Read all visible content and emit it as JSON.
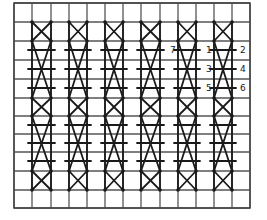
{
  "diagram": {
    "type": "stitch-chart",
    "grid": {
      "columns": 13,
      "rows": 11,
      "x_lines": [
        14,
        32,
        51,
        69,
        87,
        105,
        123,
        141,
        160,
        178,
        196,
        214,
        232,
        250
      ],
      "y_lines": [
        3,
        22,
        41,
        60,
        79,
        98,
        116,
        134,
        152,
        171,
        190,
        208
      ],
      "line_color": "#555555"
    },
    "stitch_columns": [
      {
        "x_left": 32,
        "x_right": 51
      },
      {
        "x_left": 69,
        "x_right": 87
      },
      {
        "x_left": 105,
        "x_right": 123
      },
      {
        "x_left": 141,
        "x_right": 160
      },
      {
        "x_left": 178,
        "x_right": 196
      },
      {
        "x_left": 214,
        "x_right": 232
      }
    ],
    "stitch_segments": {
      "short_crosses": [
        [
          22,
          41
        ],
        [
          98,
          116
        ],
        [
          171,
          190
        ]
      ],
      "long_crosses": [
        [
          41,
          98
        ],
        [
          116,
          171
        ]
      ],
      "bars_y": [
        50,
        69,
        88,
        125,
        143,
        161
      ]
    },
    "labels": [
      {
        "text": "7",
        "x": 170,
        "y": 53
      },
      {
        "text": "1",
        "x": 206,
        "y": 53
      },
      {
        "text": "2",
        "x": 240,
        "y": 53
      },
      {
        "text": "3",
        "x": 206,
        "y": 72
      },
      {
        "text": "4",
        "x": 240,
        "y": 72
      },
      {
        "text": "5",
        "x": 206,
        "y": 91
      },
      {
        "text": "6",
        "x": 240,
        "y": 91
      }
    ],
    "stroke_color": "#1a1a1a"
  }
}
